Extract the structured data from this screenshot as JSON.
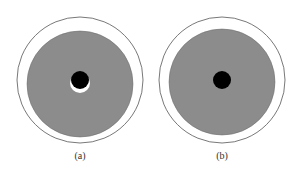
{
  "figure": {
    "panels": [
      {
        "label": "(a)",
        "outer_cx": 80,
        "outer_cy": 80,
        "outer_r": 63,
        "disk_cx": 80,
        "disk_cy": 84,
        "disk_r": 53,
        "hole_cx": 80,
        "hole_cy": 80,
        "hole_r": 9,
        "crescent": true
      },
      {
        "label": "(b)",
        "outer_cx": 222,
        "outer_cy": 80,
        "outer_r": 63,
        "disk_cx": 222,
        "disk_cy": 82,
        "disk_r": 53,
        "hole_cx": 222,
        "hole_cy": 80,
        "hole_r": 9,
        "crescent": false
      }
    ],
    "colors": {
      "disk": "#8c8c8c",
      "outline": "#555555",
      "hole": "#000000",
      "crescent": "#ffffff"
    }
  }
}
